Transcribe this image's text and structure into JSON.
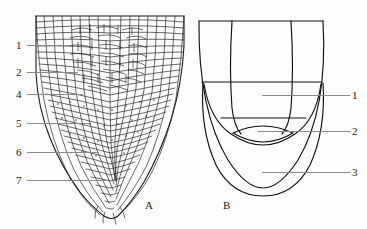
{
  "figure": {
    "background_color": "#fefefe",
    "ink_color": "#1a1a1a",
    "leader_color": "#8c8c8c"
  },
  "panel_a": {
    "letter": "A",
    "caption_x": 145,
    "caption_y": 205,
    "description": "longitudinal-section-root-tip-cellular",
    "labels": [
      {
        "text": "1",
        "x": 16,
        "y": 41,
        "leader_x": 27,
        "leader_y": 45,
        "leader_w": 44
      },
      {
        "text": "2",
        "x": 16,
        "y": 68,
        "leader_x": 27,
        "leader_y": 72,
        "leader_w": 51
      },
      {
        "text": "4",
        "x": 16,
        "y": 90,
        "leader_x": 27,
        "leader_y": 94,
        "leader_w": 56
      },
      {
        "text": "5",
        "x": 16,
        "y": 119,
        "leader_x": 27,
        "leader_y": 123,
        "leader_w": 63
      },
      {
        "text": "6",
        "x": 16,
        "y": 148,
        "leader_x": 27,
        "leader_y": 152,
        "leader_w": 72
      },
      {
        "text": "7",
        "x": 16,
        "y": 176,
        "leader_x": 27,
        "leader_y": 180,
        "leader_w": 80
      }
    ]
  },
  "panel_b": {
    "letter": "B",
    "caption_x": 223,
    "caption_y": 205,
    "description": "schematic-root-tip-zones",
    "labels": [
      {
        "text": "1",
        "x": 352,
        "y": 91,
        "leader_x": 262,
        "leader_y": 95,
        "leader_w": 88
      },
      {
        "text": "2",
        "x": 352,
        "y": 127,
        "leader_x": 258,
        "leader_y": 131,
        "leader_w": 92
      },
      {
        "text": "3",
        "x": 352,
        "y": 168,
        "leader_x": 262,
        "leader_y": 172,
        "leader_w": 88
      }
    ],
    "frame": {
      "top_y": 21,
      "left_x": 199,
      "right_x": 323,
      "bottom_y": 196
    }
  }
}
